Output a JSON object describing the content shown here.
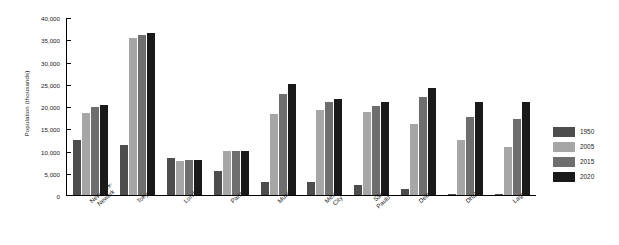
{
  "chart_data": {
    "type": "bar",
    "title": "",
    "xlabel": "",
    "ylabel": "Population (thousands)",
    "ylim": [
      0,
      40000
    ],
    "ytick_labels": [
      "40,000",
      "35,000",
      "30,000",
      "25,000",
      "20,000",
      "15,000",
      "10,000",
      "5,000",
      "0"
    ],
    "ytick_values": [
      40000,
      35000,
      30000,
      25000,
      20000,
      15000,
      10000,
      5000,
      0
    ],
    "grid": false,
    "legend_position": "right",
    "categories": [
      "New York-Newark",
      "Tokyo",
      "London",
      "Paris",
      "Mumbai",
      "Mexico City",
      "São Paulo",
      "Delhi",
      "Dhaka",
      "Lagos"
    ],
    "category_lines": [
      [
        "New York-",
        "Newark"
      ],
      [
        "Tokyo"
      ],
      [
        "London"
      ],
      [
        "Paris"
      ],
      [
        "Mumbai"
      ],
      [
        "Mexico",
        "City"
      ],
      [
        "São",
        "Paulo"
      ],
      [
        "Delhi"
      ],
      [
        "Dhaka"
      ],
      [
        "Lagos"
      ]
    ],
    "series": [
      {
        "name": "1950",
        "color": "#4d4d4d",
        "values": [
          12338,
          11275,
          8361,
          5441,
          2857,
          2883,
          2334,
          1369,
          336,
          325
        ]
      },
      {
        "name": "2005",
        "color": "#a6a6a6",
        "values": [
          18532,
          35197,
          7668,
          9820,
          18202,
          19013,
          18647,
          15926,
          12430,
          10886
        ]
      },
      {
        "name": "2015",
        "color": "#6e6e6e",
        "values": [
          19755,
          36000,
          7800,
          10000,
          22800,
          20800,
          20000,
          22000,
          17600,
          17000
        ]
      },
      {
        "name": "2020",
        "color": "#1a1a1a",
        "values": [
          20200,
          36500,
          7800,
          10000,
          25000,
          21600,
          20800,
          24000,
          21000,
          20800
        ]
      }
    ]
  },
  "legend": {
    "items": [
      {
        "label": "1950",
        "color": "#4d4d4d"
      },
      {
        "label": "2005",
        "color": "#a6a6a6"
      },
      {
        "label": "2015",
        "color": "#6e6e6e"
      },
      {
        "label": "2020",
        "color": "#1a1a1a"
      }
    ]
  }
}
